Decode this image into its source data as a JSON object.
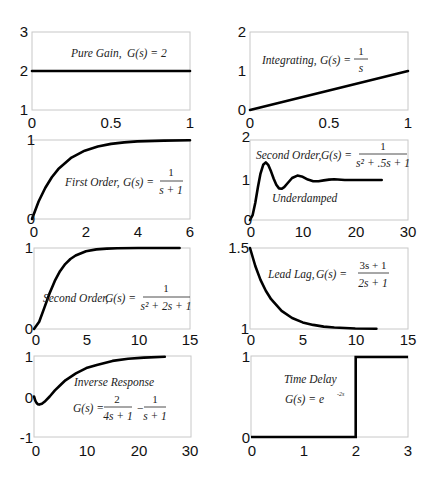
{
  "figure": {
    "panels": [
      {
        "id": "pure-gain",
        "annotation": [
          "Pure Gain",
          "G(s) = 2"
        ],
        "xticks": [
          "0",
          "0.5",
          "1"
        ],
        "yticks": [
          "1",
          "2",
          "3"
        ]
      },
      {
        "id": "integrating",
        "annotation": [
          "Integrating",
          "G(s) =",
          "1",
          "s"
        ],
        "xticks": [
          "0",
          "0.5",
          "1"
        ],
        "yticks": [
          "0",
          "1",
          "2"
        ]
      },
      {
        "id": "first-order",
        "annotation": [
          "First Order",
          "G(s) =",
          "1",
          "s + 1"
        ],
        "xticks": [
          "0",
          "2",
          "4",
          "6"
        ],
        "yticks": [
          "0",
          "1"
        ]
      },
      {
        "id": "second-order-underdamped",
        "annotation": [
          "Second Order",
          "G(s) =",
          "1",
          "s² + .5s + 1",
          "Underdamped"
        ],
        "xticks": [
          "0",
          "10",
          "20",
          "30"
        ],
        "yticks": [
          "0",
          "1",
          "2"
        ]
      },
      {
        "id": "second-order-critically-damped",
        "annotation": [
          "Second Order",
          "G(s) =",
          "1",
          "s² + 2s + 1"
        ],
        "xticks": [
          "0",
          "5",
          "10",
          "15"
        ],
        "yticks": [
          "0",
          "1"
        ]
      },
      {
        "id": "lead-lag",
        "annotation": [
          "Lead Lag",
          "G(s) =",
          "3s + 1",
          "2s + 1"
        ],
        "xticks": [
          "0",
          "5",
          "10",
          "15"
        ],
        "yticks": [
          "1",
          "1.5"
        ]
      },
      {
        "id": "inverse-response",
        "annotation": [
          "Inverse Response",
          "G(s) =",
          "2",
          "4s + 1",
          "1",
          "s + 1"
        ],
        "xticks": [
          "0",
          "10",
          "20",
          "30"
        ],
        "yticks": [
          "-1",
          "0",
          "1"
        ]
      },
      {
        "id": "time-delay",
        "annotation": [
          "Time Delay",
          "G(s) = e",
          "-2s"
        ],
        "xticks": [
          "0",
          "1",
          "2",
          "3"
        ],
        "yticks": [
          "0",
          "1"
        ]
      }
    ]
  },
  "chart_data": [
    {
      "type": "line",
      "title": "Pure Gain, G(s) = 2",
      "xlabel": "",
      "ylabel": "",
      "xlim": [
        0,
        1
      ],
      "ylim": [
        1,
        3
      ],
      "x": [
        0,
        1
      ],
      "values": [
        2,
        2
      ]
    },
    {
      "type": "line",
      "title": "Integrating, G(s) = 1/s",
      "xlabel": "",
      "ylabel": "",
      "xlim": [
        0,
        1
      ],
      "ylim": [
        0,
        2
      ],
      "x": [
        0,
        0.25,
        0.5,
        0.75,
        1
      ],
      "values": [
        0,
        0.25,
        0.5,
        0.75,
        1
      ]
    },
    {
      "type": "line",
      "title": "First Order, G(s) = 1/(s+1)",
      "xlabel": "",
      "ylabel": "",
      "xlim": [
        0,
        6
      ],
      "ylim": [
        0,
        1
      ],
      "x": [
        0,
        0.25,
        0.5,
        0.75,
        1,
        1.5,
        2,
        2.5,
        3,
        3.5,
        4,
        5,
        6
      ],
      "values": [
        0,
        0.221,
        0.393,
        0.528,
        0.632,
        0.777,
        0.865,
        0.918,
        0.95,
        0.97,
        0.982,
        0.993,
        0.998
      ]
    },
    {
      "type": "line",
      "title": "Second Order, G(s) = 1/(s^2 + .5s + 1) — Underdamped",
      "xlabel": "",
      "ylabel": "",
      "xlim": [
        0,
        30
      ],
      "ylim": [
        0,
        2
      ],
      "x": [
        0,
        0.5,
        1,
        1.5,
        2,
        2.5,
        3,
        3.5,
        4,
        4.5,
        5,
        5.5,
        6,
        6.5,
        7,
        8,
        9,
        10,
        11,
        12,
        13,
        14,
        15,
        16,
        18,
        20,
        22,
        25
      ],
      "values": [
        0,
        0.12,
        0.43,
        0.82,
        1.16,
        1.38,
        1.44,
        1.37,
        1.21,
        1.03,
        0.88,
        0.79,
        0.78,
        0.82,
        0.9,
        1.05,
        1.11,
        1.08,
        1.01,
        0.97,
        0.97,
        0.99,
        1.01,
        1.02,
        1.0,
        1.0,
        1.0,
        1.0
      ]
    },
    {
      "type": "line",
      "title": "Second Order, G(s) = 1/(s^2 + 2s + 1)",
      "xlabel": "",
      "ylabel": "",
      "xlim": [
        0,
        15
      ],
      "ylim": [
        0,
        1
      ],
      "x": [
        0,
        0.5,
        1,
        1.5,
        2,
        2.5,
        3,
        3.5,
        4,
        5,
        6,
        7,
        8,
        10,
        12,
        14
      ],
      "values": [
        0,
        0.09,
        0.264,
        0.442,
        0.594,
        0.713,
        0.801,
        0.864,
        0.908,
        0.96,
        0.983,
        0.993,
        0.997,
        1.0,
        1.0,
        1.0
      ]
    },
    {
      "type": "line",
      "title": "Lead Lag, G(s) = (3s+1)/(2s+1)",
      "xlabel": "",
      "ylabel": "",
      "xlim": [
        0,
        15
      ],
      "ylim": [
        1,
        1.5
      ],
      "x": [
        0,
        0.5,
        1,
        1.5,
        2,
        3,
        4,
        5,
        6,
        7,
        8,
        10,
        12
      ],
      "values": [
        1.5,
        1.389,
        1.303,
        1.236,
        1.184,
        1.112,
        1.068,
        1.041,
        1.025,
        1.015,
        1.009,
        1.003,
        1.001
      ]
    },
    {
      "type": "line",
      "title": "Inverse Response, G(s) = 2/(4s+1) - 1/(s+1)",
      "xlabel": "",
      "ylabel": "",
      "xlim": [
        0,
        30
      ],
      "ylim": [
        -1,
        1
      ],
      "x": [
        0,
        0.25,
        0.5,
        0.75,
        1,
        1.5,
        2,
        3,
        4,
        5,
        6,
        8,
        10,
        12,
        15,
        18,
        21,
        25
      ],
      "values": [
        0,
        -0.1,
        -0.16,
        -0.19,
        -0.2,
        -0.18,
        -0.13,
        0.0,
        0.15,
        0.28,
        0.4,
        0.57,
        0.7,
        0.78,
        0.88,
        0.93,
        0.96,
        0.98
      ]
    },
    {
      "type": "line",
      "title": "Time Delay, G(s) = e^(-2s)",
      "xlabel": "",
      "ylabel": "",
      "xlim": [
        0,
        3
      ],
      "ylim": [
        0,
        1
      ],
      "x": [
        0,
        2,
        2,
        3
      ],
      "values": [
        0,
        0,
        1,
        1
      ]
    }
  ]
}
